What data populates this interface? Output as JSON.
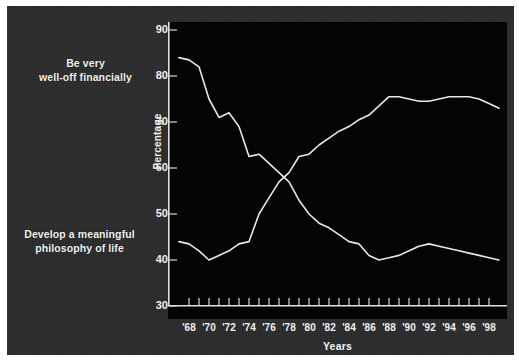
{
  "figure": {
    "background_color": "#2b2b2b",
    "plot_background_color": "#040404",
    "line_color": "#e8e8e8",
    "text_color": "#f2f2f2"
  },
  "labels": {
    "welloff_line1": "Be very",
    "welloff_line2": "well-off financially",
    "philosophy_line1": "Develop a meaningful",
    "philosophy_line2": "philosophy of life"
  },
  "chart_data": {
    "type": "line",
    "title": "",
    "xlabel": "Years",
    "ylabel": "Percentage",
    "ylim": [
      30,
      90
    ],
    "xlim": [
      1967,
      1999
    ],
    "yticks": [
      30,
      40,
      50,
      60,
      70,
      80,
      90
    ],
    "ytick_labels": [
      "30",
      "40",
      "50",
      "60",
      "70",
      "80",
      "90"
    ],
    "xtick_labels": [
      "'68",
      "'70",
      "'72",
      "'74",
      "'76",
      "'78",
      "'80",
      "'82",
      "'84",
      "'86",
      "'88",
      "'90",
      "'92",
      "'94",
      "'96",
      "'98"
    ],
    "xtick_values": [
      1968,
      1970,
      1972,
      1974,
      1976,
      1978,
      1980,
      1982,
      1984,
      1986,
      1988,
      1990,
      1992,
      1994,
      1996,
      1998
    ],
    "minor_xticks_every": 1,
    "grid": false,
    "legend_position": "left-annotations",
    "x": [
      1967,
      1968,
      1969,
      1970,
      1971,
      1972,
      1973,
      1974,
      1975,
      1976,
      1977,
      1978,
      1979,
      1980,
      1981,
      1982,
      1983,
      1984,
      1985,
      1986,
      1987,
      1988,
      1989,
      1990,
      1991,
      1992,
      1993,
      1994,
      1995,
      1996,
      1997,
      1998,
      1999
    ],
    "series": [
      {
        "name": "Develop a meaningful philosophy of life",
        "values": [
          84,
          83.5,
          82,
          75,
          71,
          72,
          69,
          62.5,
          63,
          61,
          59,
          57,
          53,
          50,
          48,
          47,
          45.5,
          44,
          43.5,
          41,
          40,
          40.5,
          41,
          42,
          43,
          43.5,
          43,
          42.5,
          42,
          41.5,
          41,
          40.5,
          40
        ]
      },
      {
        "name": "Be very well-off financially",
        "values": [
          44,
          43.5,
          42,
          40,
          41,
          42,
          43.5,
          44,
          50,
          53.5,
          57,
          59,
          62.5,
          63,
          65,
          66.5,
          68,
          69,
          70.5,
          71.5,
          73.5,
          75.5,
          75.5,
          75,
          74.5,
          74.5,
          75,
          75.5,
          75.5,
          75.5,
          75,
          74,
          73
        ]
      }
    ]
  }
}
